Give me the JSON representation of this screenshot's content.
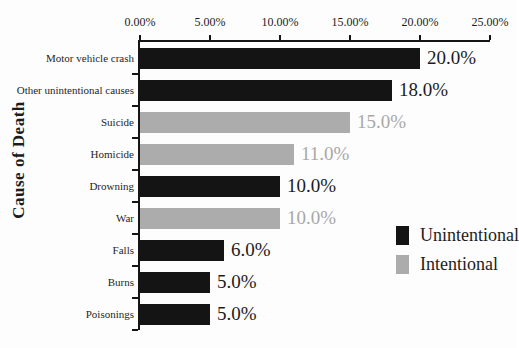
{
  "chart_data": {
    "type": "bar",
    "orientation": "horizontal",
    "title": "",
    "xlabel": "",
    "ylabel": "Cause of Death",
    "xlim": [
      0,
      25
    ],
    "grid": false,
    "x_ticks": [
      "0.00%",
      "5.00%",
      "10.00%",
      "15.00%",
      "20.00%",
      "25.00%"
    ],
    "categories": [
      "Motor vehicle crash",
      "Other unintentional causes",
      "Suicide",
      "Homicide",
      "Drowning",
      "War",
      "Falls",
      "Burns",
      "Poisonings"
    ],
    "values": [
      20,
      18,
      15,
      11,
      10,
      10,
      6,
      5,
      5
    ],
    "value_labels": [
      "20.0%",
      "18.0%",
      "15.0%",
      "11.0%",
      "10.0%",
      "10.0%",
      "6.0%",
      "5.0%",
      "5.0%"
    ],
    "groups": [
      "unintentional",
      "unintentional",
      "intentional",
      "intentional",
      "unintentional",
      "intentional",
      "unintentional",
      "unintentional",
      "unintentional"
    ],
    "colors": {
      "unintentional": "#141414",
      "intentional": "#acacac"
    },
    "value_label_colors": {
      "unintentional": "#1c1c1c",
      "intentional": "#a8a8a8"
    },
    "legend": [
      {
        "label": "Unintentional",
        "key": "unintentional",
        "color": "#141414"
      },
      {
        "label": "Intentional",
        "key": "intentional",
        "color": "#acacac"
      }
    ],
    "legend_position": "right-middle"
  }
}
